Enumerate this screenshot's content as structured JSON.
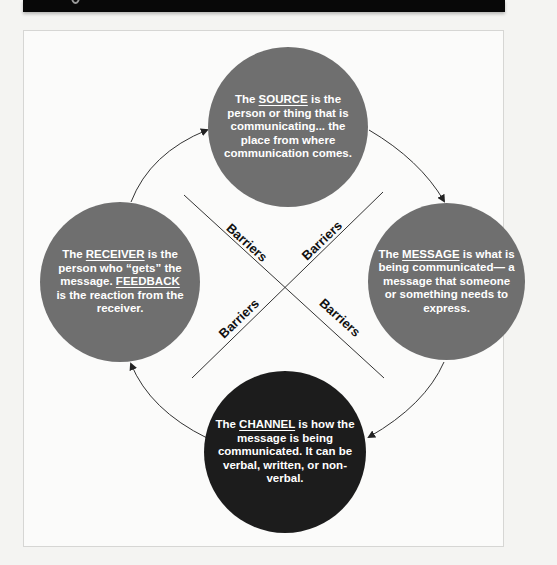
{
  "header_bar": {
    "color": "#080808"
  },
  "diagram": {
    "nodes": {
      "source": {
        "pre": "The ",
        "key": "SOURCE",
        "post": " is the person or thing that is communicating... the place from where communication comes.",
        "color": "#6f6f6f"
      },
      "message": {
        "pre": "The ",
        "key": "MESSAGE",
        "post": " is what is being communicated— a message that someone or something needs to express.",
        "color": "#6f6f6f"
      },
      "receiver": {
        "pre": "The ",
        "key": "RECEIVER",
        "mid": " is the person who “gets” the message. ",
        "key2": "FEEDBACK",
        "post": " is the reaction from the receiver.",
        "color": "#6f6f6f"
      },
      "channel": {
        "pre": "The ",
        "key": "CHANNEL",
        "post": " is how the message is being communicated. It can be verbal, written, or non-verbal.",
        "color": "#1c1c1c"
      }
    },
    "barriers": [
      "Barriers",
      "Barriers",
      "Barriers",
      "Barriers"
    ],
    "arrows": [
      {
        "from": "source",
        "to": "message"
      },
      {
        "from": "message",
        "to": "channel"
      },
      {
        "from": "channel",
        "to": "receiver"
      },
      {
        "from": "receiver",
        "to": "source"
      }
    ]
  }
}
